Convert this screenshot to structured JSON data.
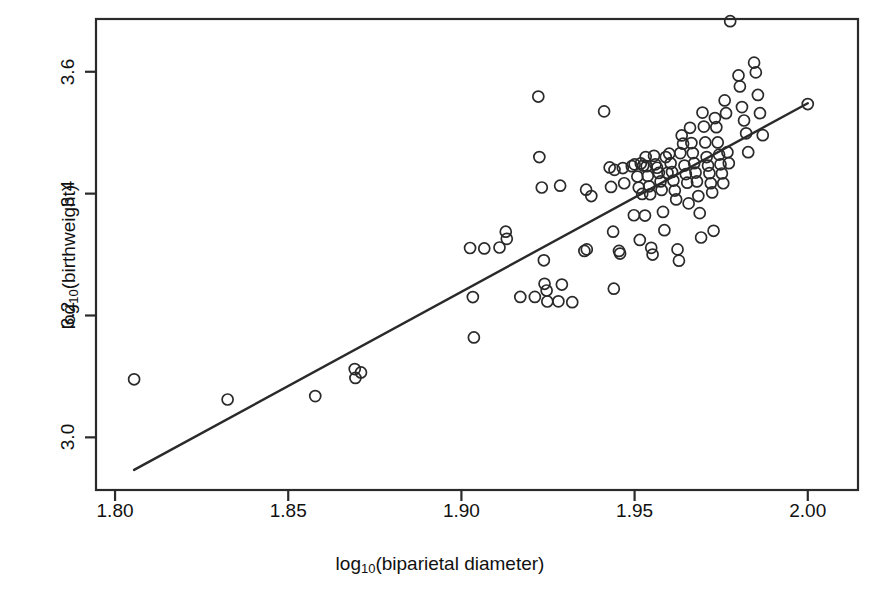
{
  "chart_data": {
    "type": "scatter",
    "title": "",
    "xlabel": "log10(biparietal diameter)",
    "ylabel": "log10(birthweight)",
    "xlabel_parts": {
      "prefix": "log",
      "sub": "10",
      "suffix": "(biparietal diameter)"
    },
    "ylabel_parts": {
      "prefix": "log",
      "sub": "10",
      "suffix": "(birthweight)"
    },
    "xlim": [
      1.7945,
      2.0145
    ],
    "ylim": [
      2.9136,
      3.6866
    ],
    "xticks": [
      1.8,
      1.85,
      1.9,
      1.95,
      2.0
    ],
    "xtick_labels": [
      "1.80",
      "1.85",
      "1.90",
      "1.95",
      "2.00"
    ],
    "yticks": [
      3.0,
      3.2,
      3.4,
      3.6
    ],
    "ytick_labels": [
      "3.0",
      "3.2",
      "3.4",
      "3.6"
    ],
    "grid": false,
    "legend": null,
    "marker": "open-circle",
    "marker_size_px": 11,
    "marker_color": "#2a2a2a",
    "line_color": "#2a2a2a",
    "frame": true,
    "frame_color": "#2a2a2a",
    "series": [
      {
        "name": "observations",
        "points": [
          [
            1.8055,
            3.0953
          ],
          [
            1.8325,
            3.0621
          ],
          [
            1.8578,
            3.0677
          ],
          [
            1.8692,
            3.112
          ],
          [
            1.8694,
            3.0975
          ],
          [
            1.871,
            3.1065
          ],
          [
            1.9025,
            3.3108
          ],
          [
            1.9033,
            3.2303
          ],
          [
            1.9036,
            3.164
          ],
          [
            1.9066,
            3.31
          ],
          [
            1.911,
            3.3116
          ],
          [
            1.9128,
            3.3375
          ],
          [
            1.9131,
            3.3258
          ],
          [
            1.917,
            3.2304
          ],
          [
            1.9212,
            3.2305
          ],
          [
            1.9222,
            3.5593
          ],
          [
            1.9225,
            3.46
          ],
          [
            1.9232,
            3.4101
          ],
          [
            1.9238,
            3.2906
          ],
          [
            1.924,
            3.252
          ],
          [
            1.9246,
            3.241
          ],
          [
            1.9248,
            3.223
          ],
          [
            1.928,
            3.2232
          ],
          [
            1.9285,
            3.413
          ],
          [
            1.929,
            3.2508
          ],
          [
            1.932,
            3.2218
          ],
          [
            1.9355,
            3.306
          ],
          [
            1.936,
            3.4065
          ],
          [
            1.9362,
            3.3085
          ],
          [
            1.9375,
            3.396
          ],
          [
            1.9412,
            3.535
          ],
          [
            1.9428,
            3.443
          ],
          [
            1.9432,
            3.411
          ],
          [
            1.9438,
            3.3375
          ],
          [
            1.944,
            3.244
          ],
          [
            1.9442,
            3.439
          ],
          [
            1.9455,
            3.306
          ],
          [
            1.9458,
            3.3016
          ],
          [
            1.9466,
            3.442
          ],
          [
            1.947,
            3.417
          ],
          [
            1.9492,
            3.445
          ],
          [
            1.9498,
            3.3645
          ],
          [
            1.95,
            3.448
          ],
          [
            1.9508,
            3.428
          ],
          [
            1.9512,
            3.41
          ],
          [
            1.9515,
            3.324
          ],
          [
            1.9518,
            3.4495
          ],
          [
            1.9522,
            3.3995
          ],
          [
            1.9525,
            3.446
          ],
          [
            1.953,
            3.364
          ],
          [
            1.9532,
            3.46
          ],
          [
            1.9535,
            3.445
          ],
          [
            1.9538,
            3.429
          ],
          [
            1.9542,
            3.412
          ],
          [
            1.9545,
            3.399
          ],
          [
            1.9548,
            3.311
          ],
          [
            1.9552,
            3.3
          ],
          [
            1.9556,
            3.462
          ],
          [
            1.956,
            3.448
          ],
          [
            1.9565,
            3.4425
          ],
          [
            1.957,
            3.434
          ],
          [
            1.9575,
            3.42
          ],
          [
            1.9578,
            3.406
          ],
          [
            1.9582,
            3.37
          ],
          [
            1.9586,
            3.34
          ],
          [
            1.959,
            3.46
          ],
          [
            1.9595,
            3.434
          ],
          [
            1.96,
            3.4655
          ],
          [
            1.9604,
            3.45
          ],
          [
            1.9608,
            3.4355
          ],
          [
            1.9612,
            3.4215
          ],
          [
            1.9616,
            3.405
          ],
          [
            1.962,
            3.3905
          ],
          [
            1.9624,
            3.3085
          ],
          [
            1.9628,
            3.29
          ],
          [
            1.9632,
            3.4665
          ],
          [
            1.9636,
            3.4955
          ],
          [
            1.964,
            3.482
          ],
          [
            1.9644,
            3.446
          ],
          [
            1.9648,
            3.432
          ],
          [
            1.9652,
            3.418
          ],
          [
            1.9656,
            3.384
          ],
          [
            1.966,
            3.508
          ],
          [
            1.9664,
            3.483
          ],
          [
            1.9668,
            3.4665
          ],
          [
            1.9672,
            3.45
          ],
          [
            1.9676,
            3.4345
          ],
          [
            1.968,
            3.42
          ],
          [
            1.9684,
            3.396
          ],
          [
            1.9688,
            3.368
          ],
          [
            1.9692,
            3.328
          ],
          [
            1.9696,
            3.533
          ],
          [
            1.97,
            3.51
          ],
          [
            1.9704,
            3.484
          ],
          [
            1.9708,
            3.46
          ],
          [
            1.9712,
            3.446
          ],
          [
            1.9716,
            3.4335
          ],
          [
            1.972,
            3.417
          ],
          [
            1.9724,
            3.402
          ],
          [
            1.9728,
            3.339
          ],
          [
            1.9732,
            3.524
          ],
          [
            1.9736,
            3.509
          ],
          [
            1.974,
            3.484
          ],
          [
            1.9744,
            3.464
          ],
          [
            1.9748,
            3.448
          ],
          [
            1.9752,
            3.433
          ],
          [
            1.9756,
            3.417
          ],
          [
            1.976,
            3.553
          ],
          [
            1.9764,
            3.532
          ],
          [
            1.9768,
            3.468
          ],
          [
            1.9772,
            3.45
          ],
          [
            1.9776,
            3.683
          ],
          [
            1.98,
            3.594
          ],
          [
            1.9804,
            3.576
          ],
          [
            1.981,
            3.542
          ],
          [
            1.9816,
            3.52
          ],
          [
            1.9822,
            3.499
          ],
          [
            1.9828,
            3.468
          ],
          [
            1.9845,
            3.615
          ],
          [
            1.985,
            3.599
          ],
          [
            1.9856,
            3.562
          ],
          [
            1.9862,
            3.532
          ],
          [
            1.987,
            3.496
          ],
          [
            2.0,
            3.547
          ]
        ]
      }
    ],
    "fit_line": {
      "name": "least-squares fit",
      "x_start": 1.8055,
      "y_start": 2.9466,
      "x_end": 2.0,
      "y_end": 3.5484,
      "slope": 3.0941,
      "intercept": -2.6418
    }
  }
}
